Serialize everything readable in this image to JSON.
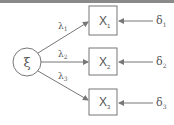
{
  "diagram": {
    "type": "factor-model-path-diagram",
    "latent": {
      "label": "ξ"
    },
    "indicators": [
      {
        "label": "X",
        "sub": "1",
        "loading": "λ",
        "loading_sub": "1",
        "error": "δ",
        "error_sub": "1"
      },
      {
        "label": "X",
        "sub": "2",
        "loading": "λ",
        "loading_sub": "2",
        "error": "δ",
        "error_sub": "2"
      },
      {
        "label": "X",
        "sub": "3",
        "loading": "λ",
        "loading_sub": "3",
        "error": "δ",
        "error_sub": "3"
      }
    ],
    "colors": {
      "stroke": "#777777",
      "text": "#555555",
      "band": "#8a8a8a"
    }
  }
}
